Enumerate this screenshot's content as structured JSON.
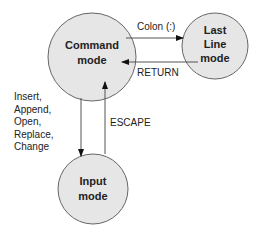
{
  "diagram": {
    "nodes": {
      "command": {
        "line1": "Command",
        "line2": "mode"
      },
      "last_line": {
        "line1": "Last",
        "line2": "Line",
        "line3": "mode"
      },
      "input": {
        "line1": "Input",
        "line2": "mode"
      }
    },
    "edges": {
      "colon": "Colon (:)",
      "return": "RETURN",
      "escape": "ESCAPE",
      "insert_list": [
        "Insert,",
        "Append,",
        "Open,",
        "Replace,",
        "Change"
      ]
    },
    "colors": {
      "node_fill": "#e6e6e6",
      "stroke": "#555555",
      "arrow": "#111111"
    }
  }
}
